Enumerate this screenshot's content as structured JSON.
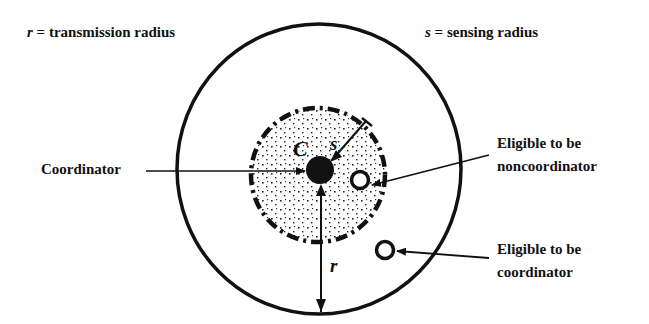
{
  "legend": {
    "r_symbol": "r",
    "r_text": " = transmission radius",
    "s_symbol": "s",
    "s_text": " = sensing radius"
  },
  "labels": {
    "coordinator": "Coordinator",
    "noncoord_line1": "Eligible to be",
    "noncoord_line2": "noncoordinator",
    "coord_line1": "Eligible to be",
    "coord_line2": "coordinator"
  },
  "symbols": {
    "center": "C",
    "sensing": "s",
    "transmission": "r"
  },
  "colors": {
    "stroke": "#111111",
    "background": "#ffffff"
  }
}
